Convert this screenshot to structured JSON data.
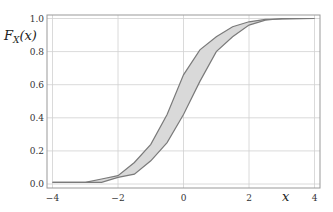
{
  "chart_data": {
    "type": "area",
    "title": "",
    "xlabel": "x",
    "ylabel": "F_X(x)",
    "xlim": [
      -4.2,
      4.2
    ],
    "ylim": [
      -0.02,
      1.02
    ],
    "grid": true,
    "legend": null,
    "x_ticks": [
      -4,
      -2,
      0,
      2,
      4
    ],
    "x_tick_labels": [
      "−4",
      "−2",
      "0",
      "2",
      "4"
    ],
    "y_ticks": [
      0.0,
      0.2,
      0.4,
      0.6,
      0.8,
      1.0
    ],
    "y_tick_labels": [
      "0.0",
      "0.2",
      "0.4",
      "0.6",
      "0.8",
      "1.0"
    ],
    "series": [
      {
        "name": "upper bound",
        "x": [
          -4,
          -3,
          -2.5,
          -2,
          -1.5,
          -1,
          -0.5,
          0,
          0.5,
          1,
          1.5,
          2,
          2.5,
          4
        ],
        "values": [
          0.01,
          0.01,
          0.03,
          0.05,
          0.13,
          0.24,
          0.42,
          0.66,
          0.81,
          0.89,
          0.95,
          0.98,
          0.995,
          1.0
        ]
      },
      {
        "name": "lower bound",
        "x": [
          -4,
          -2.5,
          -2,
          -1.5,
          -1,
          -0.5,
          0,
          0.5,
          1,
          1.5,
          2,
          2.5,
          3,
          4
        ],
        "values": [
          0.01,
          0.01,
          0.04,
          0.06,
          0.14,
          0.25,
          0.42,
          0.62,
          0.8,
          0.89,
          0.96,
          0.99,
          1.0,
          1.0
        ]
      }
    ],
    "colors": {
      "band_fill": "#d9d9d9",
      "line": "#7a7a7a",
      "grid": "#d0d0d0",
      "axis": "#999999"
    }
  }
}
